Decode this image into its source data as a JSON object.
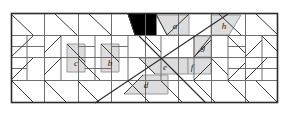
{
  "figure": {
    "canvas": {
      "width": 289,
      "height": 113
    },
    "frame": {
      "x": 11,
      "y": 13,
      "width": 267,
      "height": 90
    },
    "colors": {
      "background": "#ffffff",
      "frame_stroke": "#2b2b2b",
      "grid_stroke": "#6e6e6e",
      "diagonal_stroke": "#3a3a3a",
      "shaded_fill": "#dcdcdc",
      "shaded_stroke": "#8a8a8a",
      "black_fill": "#000000",
      "label_color": "#1a1a1a"
    },
    "labels": [
      {
        "id": "a",
        "text": "a",
        "x": 175,
        "y": 26
      },
      {
        "id": "b",
        "text": "b",
        "x": 110,
        "y": 63
      },
      {
        "id": "c",
        "text": "c",
        "x": 76,
        "y": 64
      },
      {
        "id": "d",
        "text": "d",
        "x": 146,
        "y": 84
      },
      {
        "id": "e",
        "text": "e",
        "x": 164,
        "y": 66
      },
      {
        "id": "f",
        "text": "f",
        "x": 191,
        "y": 66
      },
      {
        "id": "g",
        "text": "g",
        "x": 203,
        "y": 48
      },
      {
        "id": "h",
        "text": "h",
        "x": 224,
        "y": 26
      }
    ],
    "shaded_pieces": [
      {
        "id": "a",
        "points": "156,16 189,16 189,36 167,36"
      },
      {
        "id": "b",
        "points": "101,45 119,45 119,72 101,72"
      },
      {
        "id": "c",
        "points": "67,45 85,45 85,72 67,72"
      },
      {
        "id": "d",
        "points": "124,94 168,94 168,75 139,75"
      },
      {
        "id": "e",
        "points": "139,58 188,58 188,75 150,75"
      },
      {
        "id": "f",
        "points": "188,58 211,58 211,75 188,75"
      },
      {
        "id": "g",
        "points": "194,36 211,36 211,58 194,58"
      },
      {
        "id": "h",
        "points": "211,16 240,16 229,36 211,36"
      }
    ],
    "black_piece": {
      "id": "black-triangle",
      "points": "128,14 156,14 156,36 136,36"
    },
    "grid": {
      "columns": [
        11,
        44,
        78,
        111,
        145,
        178,
        211,
        245,
        278
      ],
      "rows": [
        13,
        35,
        58,
        80,
        103
      ],
      "note": "rectangular lattice subdivided by 45-degree diagonals"
    },
    "big_diagonals": [
      {
        "id": "x-diagonal-down",
        "x1": 139,
        "y1": 36,
        "x2": 240,
        "y2": 103
      },
      {
        "id": "x-diagonal-up",
        "x1": 245,
        "y1": 14,
        "x2": 95,
        "y2": 103
      }
    ]
  }
}
